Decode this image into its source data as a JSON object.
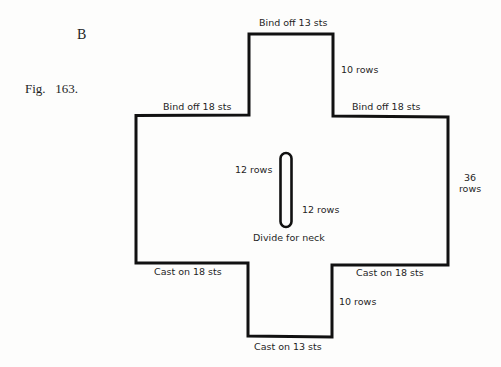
{
  "figure": {
    "letter": "B",
    "caption": "Fig.   163."
  },
  "diagram": {
    "labels": {
      "top_bind_off": "Bind off 13 sts",
      "top_rows": "10 rows",
      "left_bind_off": "Bind off 18 sts",
      "right_bind_off": "Bind off 18 sts",
      "side_rows_line1": "36",
      "side_rows_line2": "rows",
      "neck_rows_upper": "12 rows",
      "neck_rows_lower": "12 rows",
      "neck_divide": "Divide for neck",
      "left_cast_on": "Cast on 18 sts",
      "right_cast_on": "Cast on 18 sts",
      "bottom_rows": "10 rows",
      "bottom_cast_on": "Cast on 13 sts"
    },
    "outline_color": "#111111"
  }
}
